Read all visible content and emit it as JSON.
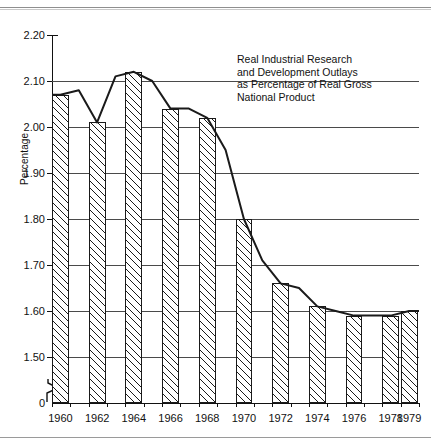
{
  "figure": {
    "annotation": "Real Industrial Research\nand Development Outlays\nas Percentage of Real Gross\nNational Product",
    "ylabel": "Percentage",
    "ytick_labels": [
      "2.20",
      "2.10",
      "2.00",
      "1.90",
      "1.80",
      "1.70",
      "1.60",
      "1.50",
      "0"
    ],
    "xtick_labels": [
      "1960",
      "1962",
      "1964",
      "1966",
      "1968",
      "1970",
      "1972",
      "1974",
      "1976",
      "1978",
      "1979"
    ],
    "line_color": "#1a1a1a",
    "grid_color": "#4a4a4a",
    "bar_fill": "#ffffff",
    "bar_edge": "#1a1a1a"
  },
  "chart_data": {
    "type": "bar",
    "title": "Real Industrial Research and Development Outlays as Percentage of Real Gross National Product",
    "subtitle": "",
    "xlabel": "",
    "ylabel": "Percentage",
    "ylim": [
      1.45,
      2.2
    ],
    "axis_break": {
      "below": 1.45,
      "to": 0,
      "label": "0"
    },
    "grid": true,
    "gridlines": [
      2.1,
      2.0,
      1.9,
      1.8,
      1.7,
      1.6,
      1.5
    ],
    "yticks": [
      2.2,
      2.1,
      2.0,
      1.9,
      1.8,
      1.7,
      1.6,
      1.5,
      0
    ],
    "legend": "none",
    "categories": [
      1960,
      1961,
      1962,
      1963,
      1964,
      1965,
      1966,
      1967,
      1968,
      1969,
      1970,
      1971,
      1972,
      1973,
      1974,
      1975,
      1976,
      1977,
      1978,
      1979
    ],
    "labeled_categories": [
      1960,
      1962,
      1964,
      1966,
      1968,
      1970,
      1972,
      1974,
      1976,
      1978,
      1979
    ],
    "values": [
      2.07,
      2.08,
      2.01,
      2.11,
      2.12,
      2.1,
      2.04,
      2.04,
      2.02,
      1.95,
      1.8,
      1.71,
      1.66,
      1.65,
      1.61,
      1.6,
      1.59,
      1.59,
      1.59,
      1.6
    ],
    "series": [
      {
        "name": "Real Industrial R&D Outlays as % of Real GNP",
        "values": [
          2.07,
          2.08,
          2.01,
          2.11,
          2.12,
          2.1,
          2.04,
          2.04,
          2.02,
          1.95,
          1.8,
          1.71,
          1.66,
          1.65,
          1.61,
          1.6,
          1.59,
          1.59,
          1.59,
          1.6
        ]
      }
    ],
    "bars": [
      {
        "year": 1960,
        "value": 2.07
      },
      {
        "year": 1962,
        "value": 2.01
      },
      {
        "year": 1964,
        "value": 2.12
      },
      {
        "year": 1966,
        "value": 2.04
      },
      {
        "year": 1968,
        "value": 2.02
      },
      {
        "year": 1970,
        "value": 1.8
      },
      {
        "year": 1972,
        "value": 1.66
      },
      {
        "year": 1974,
        "value": 1.61
      },
      {
        "year": 1976,
        "value": 1.59
      },
      {
        "year": 1978,
        "value": 1.59
      },
      {
        "year": 1979,
        "value": 1.6
      }
    ]
  }
}
